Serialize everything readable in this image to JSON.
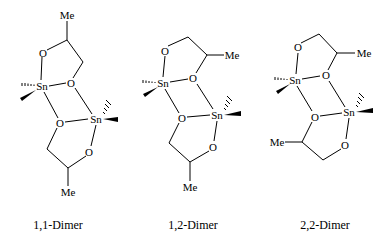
{
  "figure": {
    "structures": [
      {
        "name": "1,1-Dimer",
        "label": "1,1-Dimer",
        "atoms": {
          "me_top": "Me",
          "o1": "O",
          "sn1": "Sn",
          "o2": "O",
          "o3": "O",
          "sn2": "Sn",
          "o4": "O",
          "me_bot": "Me"
        }
      },
      {
        "name": "1,2-Dimer",
        "label": "1,2-Dimer",
        "atoms": {
          "me_top": "Me",
          "o1": "O",
          "sn1": "Sn",
          "o2": "O",
          "o3": "O",
          "sn2": "Sn",
          "o4": "O",
          "me_bot": "Me"
        }
      },
      {
        "name": "2,2-Dimer",
        "label": "2,2-Dimer",
        "atoms": {
          "me_top": "Me",
          "o1": "O",
          "sn1": "Sn",
          "o2": "O",
          "o3": "O",
          "sn2": "Sn",
          "o4": "O",
          "me_bot": "Me"
        }
      }
    ]
  }
}
